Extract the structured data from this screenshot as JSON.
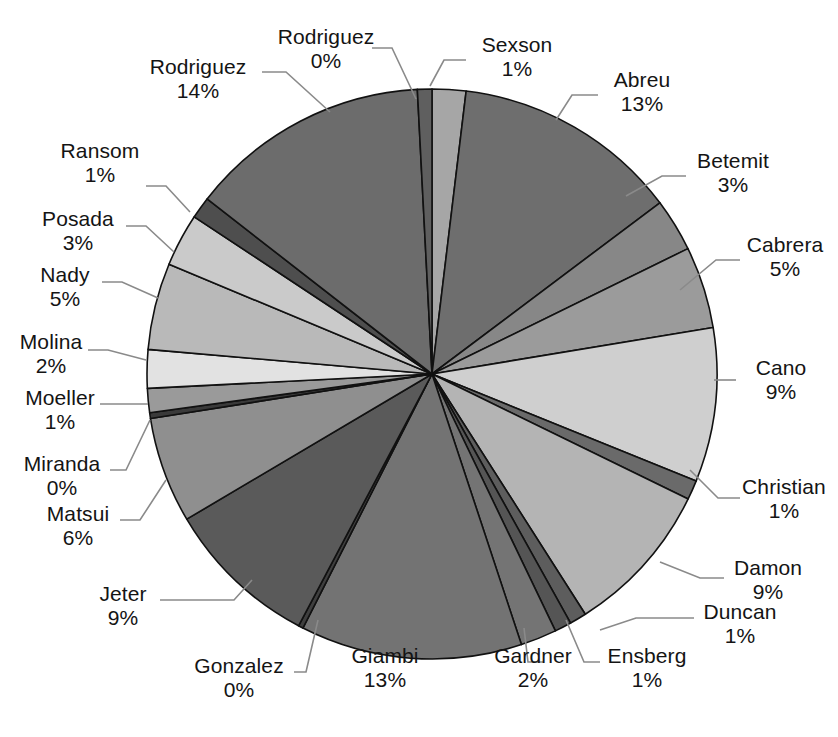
{
  "chart_data": {
    "type": "pie",
    "title": "",
    "title_clipped": true,
    "xlabel": "",
    "ylabel": "",
    "legend": "none",
    "labels_show_name_and_percent": true,
    "start_angle_deg": 0,
    "direction": "clockwise",
    "categories": [
      "Sexson",
      "Abreu",
      "Betemit",
      "Cabrera",
      "Cano",
      "Christian",
      "Damon",
      "Duncan",
      "Ensberg",
      "Gardner",
      "Giambi",
      "Gonzalez",
      "Jeter",
      "Matsui",
      "Miranda",
      "Moeller",
      "Molina",
      "Nady",
      "Posada",
      "Ransom",
      "Rodriguez",
      "Rodriguez"
    ],
    "values": [
      1,
      13,
      3,
      5,
      9,
      1,
      9,
      1,
      1,
      2,
      13,
      0,
      9,
      6,
      0,
      1,
      2,
      5,
      3,
      1,
      14,
      0
    ],
    "percent_labels": [
      "1%",
      "13%",
      "3%",
      "5%",
      "9%",
      "1%",
      "9%",
      "1%",
      "1%",
      "2%",
      "13%",
      "0%",
      "9%",
      "6%",
      "0%",
      "1%",
      "2%",
      "5%",
      "3%",
      "1%",
      "14%",
      "0%"
    ],
    "slices": [
      {
        "name": "Sexson",
        "percent": "1%",
        "value": 1,
        "sweep": 7.0,
        "color": "#a6a6a6"
      },
      {
        "name": "Abreu",
        "percent": "13%",
        "value": 13,
        "sweep": 47.0,
        "color": "#6e6e6e"
      },
      {
        "name": "Betemit",
        "percent": "3%",
        "value": 3,
        "sweep": 11.0,
        "color": "#878787"
      },
      {
        "name": "Cabrera",
        "percent": "5%",
        "value": 5,
        "sweep": 17.0,
        "color": "#9b9b9b"
      },
      {
        "name": "Cano",
        "percent": "9%",
        "value": 9,
        "sweep": 32.0,
        "color": "#cfcfcf"
      },
      {
        "name": "Christian",
        "percent": "1%",
        "value": 1,
        "sweep": 4.0,
        "color": "#6a6a6a"
      },
      {
        "name": "Damon",
        "percent": "9%",
        "value": 9,
        "sweep": 32.0,
        "color": "#b4b4b4"
      },
      {
        "name": "Duncan",
        "percent": "1%",
        "value": 1,
        "sweep": 3.5,
        "color": "#5d5d5d"
      },
      {
        "name": "Ensberg",
        "percent": "1%",
        "value": 1,
        "sweep": 3.5,
        "color": "#555555"
      },
      {
        "name": "Gardner",
        "percent": "2%",
        "value": 2,
        "sweep": 7.5,
        "color": "#747474"
      },
      {
        "name": "Giambi",
        "percent": "13%",
        "value": 13,
        "sweep": 46.0,
        "color": "#737373"
      },
      {
        "name": "Gonzalez",
        "percent": "0%",
        "value": 0,
        "sweep": 1.0,
        "color": "#3f3f3f"
      },
      {
        "name": "Jeter",
        "percent": "9%",
        "value": 9,
        "sweep": 32.0,
        "color": "#5a5a5a"
      },
      {
        "name": "Matsui",
        "percent": "6%",
        "value": 6,
        "sweep": 22.0,
        "color": "#8f8f8f"
      },
      {
        "name": "Miranda",
        "percent": "0%",
        "value": 0,
        "sweep": 1.2,
        "color": "#3a3a3a"
      },
      {
        "name": "Moeller",
        "percent": "1%",
        "value": 1,
        "sweep": 5.0,
        "color": "#9a9a9a"
      },
      {
        "name": "Molina",
        "percent": "2%",
        "value": 2,
        "sweep": 8.0,
        "color": "#e2e2e2"
      },
      {
        "name": "Nady",
        "percent": "5%",
        "value": 5,
        "sweep": 18.0,
        "color": "#b9b9b9"
      },
      {
        "name": "Posada",
        "percent": "3%",
        "value": 3,
        "sweep": 11.0,
        "color": "#cacaca"
      },
      {
        "name": "Ransom",
        "percent": "1%",
        "value": 1,
        "sweep": 4.5,
        "color": "#4e4e4e"
      },
      {
        "name": "Rodriguez",
        "percent": "14%",
        "value": 14,
        "sweep": 50.0,
        "color": "#6c6c6c"
      },
      {
        "name": "Rodriguez",
        "percent": "0%",
        "value": 0,
        "sweep": 3.0,
        "color": "#5f5f5f"
      }
    ],
    "geometry": {
      "cx": 432,
      "cy": 374,
      "r": 285
    },
    "colors": {
      "stroke": "#111111",
      "background": "#ffffff",
      "text": "#141414",
      "leader": "#8a8a8a"
    }
  },
  "labels": {
    "sexson": {
      "name": "Sexson",
      "percent": "1%"
    },
    "abreu": {
      "name": "Abreu",
      "percent": "13%"
    },
    "betemit": {
      "name": "Betemit",
      "percent": "3%"
    },
    "cabrera": {
      "name": "Cabrera",
      "percent": "5%"
    },
    "cano": {
      "name": "Cano",
      "percent": "9%"
    },
    "christian": {
      "name": "Christian",
      "percent": "1%"
    },
    "damon": {
      "name": "Damon",
      "percent": "9%"
    },
    "duncan": {
      "name": "Duncan",
      "percent": "1%"
    },
    "ensberg": {
      "name": "Ensberg",
      "percent": "1%"
    },
    "gardner": {
      "name": "Gardner",
      "percent": "2%"
    },
    "giambi": {
      "name": "Giambi",
      "percent": "13%"
    },
    "gonzalez": {
      "name": "Gonzalez",
      "percent": "0%"
    },
    "jeter": {
      "name": "Jeter",
      "percent": "9%"
    },
    "matsui": {
      "name": "Matsui",
      "percent": "6%"
    },
    "miranda": {
      "name": "Miranda",
      "percent": "0%"
    },
    "moeller": {
      "name": "Moeller",
      "percent": "1%"
    },
    "molina": {
      "name": "Molina",
      "percent": "2%"
    },
    "nady": {
      "name": "Nady",
      "percent": "5%"
    },
    "posada": {
      "name": "Posada",
      "percent": "3%"
    },
    "ransom": {
      "name": "Ransom",
      "percent": "1%"
    },
    "rodriguez_big": {
      "name": "Rodriguez",
      "percent": "14%"
    },
    "rodriguez_small": {
      "name": "Rodriguez",
      "percent": "0%"
    }
  }
}
